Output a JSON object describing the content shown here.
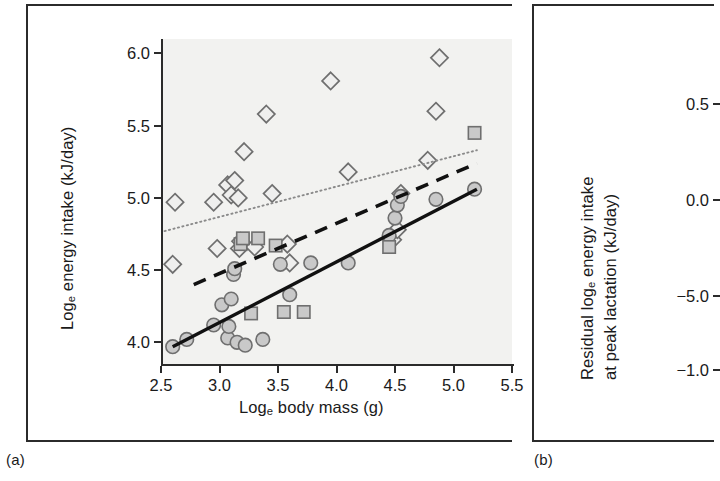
{
  "figure": {
    "panels": [
      {
        "caption": "(a)"
      },
      {
        "caption": "(b)"
      }
    ]
  },
  "panel_a": {
    "ylabel_pre": "Log",
    "ylabel_sub": "e",
    "ylabel_post": " energy intake (kJ/day)",
    "xlabel_pre": "Log",
    "xlabel_sub": "e",
    "xlabel_post": " body mass (g)"
  },
  "panel_b": {
    "ylabel_line1_pre": "Residual log",
    "ylabel_line1_sub": "e",
    "ylabel_line1_post": " energy intake",
    "ylabel_line2": "at peak lactation (kJ/day)"
  },
  "chart_data": [
    {
      "type": "scatter",
      "panel": "(a)",
      "title": "",
      "xlabel": "Log_e body mass (g)",
      "ylabel": "Log_e energy intake (kJ/day)",
      "xlim": [
        2.5,
        5.5
      ],
      "ylim": [
        3.85,
        6.1
      ],
      "xticks": [
        "2.5",
        "3.0",
        "3.5",
        "4.0",
        "4.5",
        "5.0",
        "5.5"
      ],
      "xtick_values": [
        2.5,
        3.0,
        3.5,
        4.0,
        4.5,
        5.0,
        5.5
      ],
      "yticks": [
        "6.0",
        "5.5",
        "5.0",
        "4.5",
        "4.0"
      ],
      "ytick_values": [
        6.0,
        5.5,
        5.0,
        4.5,
        4.0
      ],
      "grid": false,
      "legend": "none",
      "plot_background": "#f2f2f0",
      "marker_fill": "#c9c9c9",
      "marker_stroke": "#6f6f6f",
      "series": [
        {
          "name": "diamond",
          "marker": "diamond",
          "fit_line": "dotted",
          "fit_color": "#8a8a8a",
          "fit_endpoints": [
            [
              2.53,
              4.77
            ],
            [
              5.2,
              5.33
            ]
          ],
          "points": [
            [
              2.6,
              4.54
            ],
            [
              2.62,
              4.97
            ],
            [
              2.95,
              4.97
            ],
            [
              2.98,
              4.65
            ],
            [
              3.07,
              5.09
            ],
            [
              3.1,
              5.02
            ],
            [
              3.13,
              5.12
            ],
            [
              3.16,
              5.0
            ],
            [
              3.17,
              4.65
            ],
            [
              3.18,
              4.7
            ],
            [
              3.21,
              5.32
            ],
            [
              3.3,
              4.66
            ],
            [
              3.4,
              5.58
            ],
            [
              3.45,
              5.03
            ],
            [
              3.58,
              4.68
            ],
            [
              3.6,
              4.55
            ],
            [
              3.95,
              5.81
            ],
            [
              4.1,
              5.18
            ],
            [
              4.48,
              4.71
            ],
            [
              4.52,
              4.78
            ],
            [
              4.55,
              5.03
            ],
            [
              4.78,
              5.26
            ],
            [
              4.85,
              5.6
            ],
            [
              4.88,
              5.97
            ]
          ]
        },
        {
          "name": "circle",
          "marker": "circle",
          "fit_line": "solid",
          "fit_color": "#111111",
          "fit_endpoints": [
            [
              2.6,
              3.97
            ],
            [
              5.2,
              5.06
            ]
          ],
          "points": [
            [
              2.6,
              3.97
            ],
            [
              2.72,
              4.02
            ],
            [
              2.95,
              4.12
            ],
            [
              3.02,
              4.26
            ],
            [
              3.07,
              4.03
            ],
            [
              3.08,
              4.11
            ],
            [
              3.1,
              4.3
            ],
            [
              3.12,
              4.47
            ],
            [
              3.13,
              4.51
            ],
            [
              3.15,
              4.0
            ],
            [
              3.22,
              3.98
            ],
            [
              3.37,
              4.02
            ],
            [
              3.52,
              4.54
            ],
            [
              3.6,
              4.33
            ],
            [
              3.78,
              4.55
            ],
            [
              4.1,
              4.55
            ],
            [
              4.45,
              4.74
            ],
            [
              4.5,
              4.86
            ],
            [
              4.52,
              4.95
            ],
            [
              4.55,
              5.01
            ],
            [
              4.85,
              4.99
            ],
            [
              5.18,
              5.06
            ]
          ]
        },
        {
          "name": "square",
          "marker": "square",
          "fit_line": "dashed",
          "fit_color": "#111111",
          "fit_endpoints": [
            [
              2.78,
              4.4
            ],
            [
              5.2,
              5.24
            ]
          ],
          "points": [
            [
              3.18,
              4.68
            ],
            [
              3.2,
              4.72
            ],
            [
              3.27,
              4.2
            ],
            [
              3.33,
              4.72
            ],
            [
              3.48,
              4.67
            ],
            [
              3.55,
              4.21
            ],
            [
              3.72,
              4.21
            ],
            [
              4.45,
              4.66
            ],
            [
              5.18,
              5.45
            ]
          ]
        }
      ]
    },
    {
      "type": "scatter",
      "panel": "(b)",
      "title": "",
      "xlabel": "",
      "ylabel": "Residual log_e energy intake at peak lactation (kJ/day)",
      "yticks": [
        "0.5",
        "0.0",
        "−5.0",
        "−1.0"
      ],
      "ytick_values": [
        0.5,
        0.0,
        -0.5,
        -1.0
      ],
      "grid": false,
      "legend": "none",
      "note": "panel cropped at right edge of image; plotting area not visible",
      "series": []
    }
  ]
}
